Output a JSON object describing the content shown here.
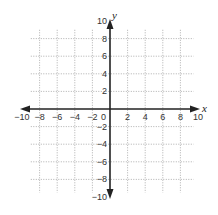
{
  "chart_data": {
    "type": "scatter",
    "title": "",
    "xlabel": "x",
    "ylabel": "y",
    "xlim": [
      -10,
      10
    ],
    "ylim": [
      -10,
      10
    ],
    "grid": true,
    "grid_style": "dotted",
    "x_ticks": [
      -10,
      -8,
      -6,
      -4,
      -2,
      2,
      4,
      6,
      8,
      10
    ],
    "y_ticks": [
      -10,
      -8,
      -6,
      -4,
      -2,
      2,
      4,
      6,
      8,
      10
    ],
    "origin_label": "0",
    "points": []
  },
  "labels": {
    "x_axis": "x",
    "y_axis": "y",
    "origin": "0"
  },
  "colors": {
    "axis": "#222222",
    "grid": "#9a9a9a",
    "text": "#333333"
  }
}
